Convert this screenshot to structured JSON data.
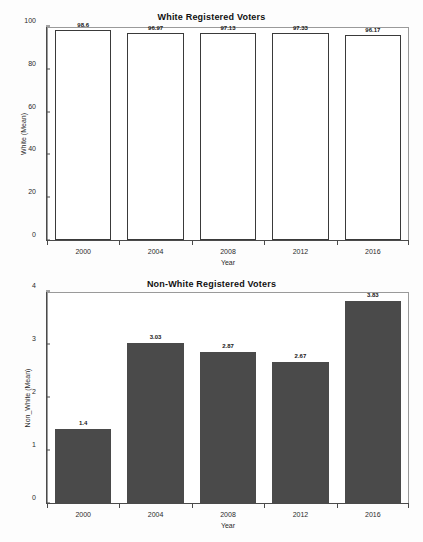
{
  "chart_data": [
    {
      "type": "bar",
      "id": "white-registered-voters",
      "title": "White Registered Voters",
      "xlabel": "Year",
      "ylabel": "White (Mean)",
      "categories": [
        "2000",
        "2004",
        "2008",
        "2012",
        "2016"
      ],
      "values": [
        98.6,
        96.97,
        97.13,
        97.33,
        96.17
      ],
      "value_labels": [
        "98.6",
        "96.97",
        "97.13",
        "97.33",
        "96.17"
      ],
      "ylim": [
        0,
        100
      ],
      "yticks": [
        0,
        20,
        40,
        60,
        80,
        100
      ],
      "ytick_labels": [
        "0",
        "20",
        "40",
        "60",
        "80",
        "100"
      ],
      "grid": false,
      "legend": false,
      "bar_style": "outline",
      "bar_fill": "#ffffff",
      "bar_edge": "#3a3a3a"
    },
    {
      "type": "bar",
      "id": "non-white-registered-voters",
      "title": "Non-White Registered Voters",
      "xlabel": "Year",
      "ylabel": "Non_White (Mean)",
      "categories": [
        "2000",
        "2004",
        "2008",
        "2012",
        "2016"
      ],
      "values": [
        1.4,
        3.03,
        2.87,
        2.67,
        3.83
      ],
      "value_labels": [
        "1.4",
        "3.03",
        "2.87",
        "2.67",
        "3.83"
      ],
      "ylim": [
        0,
        4
      ],
      "yticks": [
        0,
        1,
        2,
        3,
        4
      ],
      "ytick_labels": [
        "0",
        "1",
        "2",
        "3",
        "4"
      ],
      "grid": false,
      "legend": false,
      "bar_style": "filled",
      "bar_fill": "#4a4a4a",
      "bar_edge": "#4a4a4a"
    }
  ]
}
